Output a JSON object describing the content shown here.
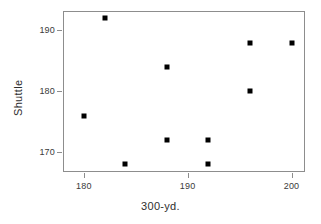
{
  "chart_data": {
    "type": "scatter",
    "title": "",
    "xlabel": "300-yd.",
    "ylabel": "Shuttle",
    "xlim": [
      178.0,
      201.3
    ],
    "ylim": [
      166.7,
      193.2
    ],
    "grid": false,
    "legend": null,
    "marker": {
      "shape": "square",
      "color": "#000000",
      "size": 5
    },
    "xticks": [
      180,
      190,
      200
    ],
    "xticklabels": [
      "180",
      "190",
      "200"
    ],
    "yticks": [
      170,
      180,
      190
    ],
    "yticklabels": [
      "170",
      "180",
      "190"
    ],
    "points": [
      {
        "x": 180,
        "y": 176
      },
      {
        "x": 182,
        "y": 192
      },
      {
        "x": 184,
        "y": 168
      },
      {
        "x": 188,
        "y": 184
      },
      {
        "x": 188,
        "y": 172
      },
      {
        "x": 192,
        "y": 172
      },
      {
        "x": 192,
        "y": 168
      },
      {
        "x": 196,
        "y": 188
      },
      {
        "x": 196,
        "y": 180
      },
      {
        "x": 200,
        "y": 188
      }
    ],
    "colors": {
      "point": "#000000",
      "frame": "#8d8d8d",
      "tick": "#8d8d8d",
      "text": "#2e2e2e",
      "background": "#ffffff"
    }
  }
}
